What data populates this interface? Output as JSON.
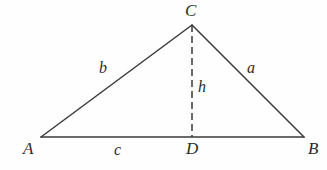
{
  "figure": {
    "type": "geometry-diagram",
    "background_color": "#fefefe",
    "stroke_color": "#3a3a3a",
    "label_color": "#2b2b2b",
    "canvas": {
      "width": 327,
      "height": 170
    }
  },
  "vertices": [
    {
      "id": "A",
      "label": "A",
      "x": 41,
      "y": 137,
      "label_x": 23,
      "label_y": 140
    },
    {
      "id": "B",
      "label": "B",
      "x": 304,
      "y": 137,
      "label_x": 308,
      "label_y": 140
    },
    {
      "id": "C",
      "label": "C",
      "x": 192,
      "y": 25,
      "label_x": 185,
      "label_y": 2
    },
    {
      "id": "D",
      "label": "D",
      "x": 192,
      "y": 137,
      "label_x": 186,
      "label_y": 140
    }
  ],
  "edges": [
    {
      "id": "AC",
      "label": "b",
      "from": "A",
      "to": "C",
      "style": "solid",
      "label_x": 99,
      "label_y": 60
    },
    {
      "id": "CB",
      "label": "a",
      "from": "C",
      "to": "B",
      "style": "solid",
      "label_x": 247,
      "label_y": 60
    },
    {
      "id": "AB",
      "label": "c",
      "from": "A",
      "to": "B",
      "style": "solid",
      "label_x": 114,
      "label_y": 142
    },
    {
      "id": "CD",
      "label": "h",
      "from": "C",
      "to": "D",
      "style": "dashed",
      "label_x": 198,
      "label_y": 79
    }
  ],
  "dash_pattern": "7 4",
  "stroke_width": 1.5
}
